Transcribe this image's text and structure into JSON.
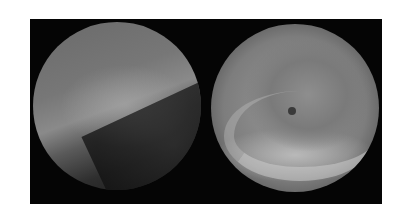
{
  "figure": {
    "panels": [
      {
        "name": "left-endoscopic-view",
        "content": "mucosal surface with cobblestone texture, dark lumen at lower right"
      },
      {
        "name": "right-endoscopic-view",
        "content": "rounded lesion surrounded by folds, small dark spot near center"
      }
    ],
    "colors": {
      "background": "#ffffff",
      "panel": "#050505"
    }
  }
}
